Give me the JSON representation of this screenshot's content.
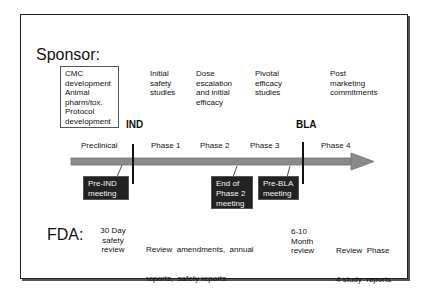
{
  "sponsor": {
    "label": "Sponsor:",
    "preclinical_box": [
      "CMC",
      "development",
      "Animal",
      "pharm/tox.",
      "Protocol",
      "development"
    ],
    "phase_notes": [
      [
        "Initial",
        "safety",
        "studies"
      ],
      [
        "Dose",
        "escalation",
        "and initial",
        "efficacy"
      ],
      [
        "Pivotal",
        "efficacy",
        "studies"
      ],
      [
        "Post",
        "marketing",
        "commitments"
      ]
    ]
  },
  "milestones": {
    "ind": "IND",
    "bla": "BLA"
  },
  "timeline": {
    "stages": [
      "Preclinical",
      "Phase 1",
      "Phase 2",
      "Phase 3",
      "Phase 4"
    ],
    "arrow_color": "#8a8a8a"
  },
  "meetings": [
    [
      "Pre-IND",
      "meeting"
    ],
    [
      "End of",
      "Phase 2",
      "meeting"
    ],
    [
      "Pre-BLA",
      "meeting"
    ]
  ],
  "fda": {
    "label": "FDA:",
    "notes": {
      "ind_review": [
        "30 Day",
        "safety",
        "review"
      ],
      "ongoing": [
        "Review  amendments,  annual",
        "reports,  safety reports"
      ],
      "bla_review": [
        "6-10",
        "Month",
        "review"
      ],
      "phase4": [
        "Review  Phase",
        "4 study  reports"
      ]
    }
  }
}
